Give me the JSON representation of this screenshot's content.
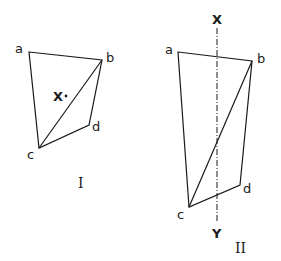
{
  "figures": [
    {
      "id": "I",
      "caption": "I",
      "vertices": {
        "a": {
          "label": "a",
          "x": 29,
          "y": 52
        },
        "b": {
          "label": "b",
          "x": 102,
          "y": 60
        },
        "c": {
          "label": "c",
          "x": 39,
          "y": 148
        },
        "d": {
          "label": "d",
          "x": 89,
          "y": 125
        }
      },
      "edges": [
        [
          "a",
          "b"
        ],
        [
          "b",
          "d"
        ],
        [
          "d",
          "c"
        ],
        [
          "c",
          "a"
        ],
        [
          "b",
          "c"
        ]
      ],
      "point": {
        "label": "X",
        "x": 66,
        "y": 96
      }
    },
    {
      "id": "II",
      "caption": "II",
      "vertices": {
        "a": {
          "label": "a",
          "x": 178,
          "y": 52
        },
        "b": {
          "label": "b",
          "x": 252,
          "y": 61
        },
        "c": {
          "label": "c",
          "x": 189,
          "y": 207
        },
        "d": {
          "label": "d",
          "x": 240,
          "y": 185
        }
      },
      "edges": [
        [
          "a",
          "b"
        ],
        [
          "b",
          "d"
        ],
        [
          "d",
          "c"
        ],
        [
          "c",
          "a"
        ],
        [
          "b",
          "c"
        ]
      ],
      "axis": {
        "top_label": "X",
        "bottom_label": "Y",
        "x": 217,
        "y1": 28,
        "y2": 222,
        "style": "dash-dot"
      }
    }
  ],
  "colors": {
    "stroke": "#1a1a1a",
    "background": "#ffffff"
  }
}
